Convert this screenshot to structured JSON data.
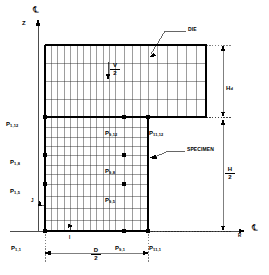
{
  "figure": {
    "axes": {
      "vertical_axis_label": "Z",
      "horizontal_axis_label": "R",
      "centerline_symbol_top": "℄",
      "centerline_symbol_right": "℄"
    },
    "annotations": {
      "die_label": "DIE",
      "specimen_label": "SPECIMEN",
      "velocity_numerator": "V",
      "velocity_denominator": "2",
      "die_height_label": "H",
      "die_height_subscript": "d",
      "specimen_height_numerator": "H",
      "specimen_height_denominator": "2",
      "diameter_numerator": "D",
      "diameter_denominator": "2",
      "index_i_label": "I",
      "index_j_label": "J"
    },
    "nodes": [
      {
        "id": "P1_12",
        "base": "P",
        "sub": "1,12",
        "x": 45,
        "y": 117,
        "dot": true,
        "label_x": 6,
        "label_y": 113,
        "label_anchor": "left"
      },
      {
        "id": "P1_8",
        "base": "P",
        "sub": "1,8",
        "x": 45,
        "y": 155,
        "dot": true,
        "label_x": 10,
        "label_y": 151,
        "label_anchor": "left"
      },
      {
        "id": "P1_5",
        "base": "P",
        "sub": "1,5",
        "x": 45,
        "y": 184,
        "dot": true,
        "label_x": 10,
        "label_y": 180,
        "label_anchor": "left"
      },
      {
        "id": "P1_1",
        "base": "P",
        "sub": "1,1",
        "x": 45,
        "y": 231,
        "dot": true,
        "label_x": 11,
        "label_y": 237,
        "label_anchor": "left"
      },
      {
        "id": "P9_12",
        "base": "P",
        "sub": "9,12",
        "x": 124,
        "y": 117,
        "dot": true,
        "label_x": 105,
        "label_y": 122,
        "label_anchor": "left"
      },
      {
        "id": "P9_8",
        "base": "P",
        "sub": "9,8",
        "x": 124,
        "y": 155,
        "dot": true,
        "label_x": 105,
        "label_y": 160,
        "label_anchor": "left"
      },
      {
        "id": "P9_5",
        "base": "P",
        "sub": "9,5",
        "x": 124,
        "y": 184,
        "dot": true,
        "label_x": 105,
        "label_y": 189,
        "label_anchor": "left"
      },
      {
        "id": "P9_1",
        "base": "P",
        "sub": "9,1",
        "x": 124,
        "y": 231,
        "dot": true,
        "label_x": 115,
        "label_y": 237,
        "label_anchor": "left"
      },
      {
        "id": "P11_12",
        "base": "P",
        "sub": "11,12",
        "x": 148,
        "y": 117,
        "dot": true,
        "label_x": 149,
        "label_y": 122,
        "label_anchor": "left"
      },
      {
        "id": "P11_1",
        "base": "P",
        "sub": "11,1",
        "x": 148,
        "y": 231,
        "dot": true,
        "label_x": 149,
        "label_y": 237,
        "label_anchor": "left"
      }
    ],
    "geometry": {
      "mesh_left_x": 45,
      "mesh_right_specimen_x": 148,
      "mesh_right_die_x": 206,
      "mesh_top_y": 45,
      "die_bottom_y": 117,
      "mesh_bottom_y": 231,
      "vertical_column_count": 16,
      "die_row_count": 4,
      "specimen_row_count": 11
    }
  }
}
